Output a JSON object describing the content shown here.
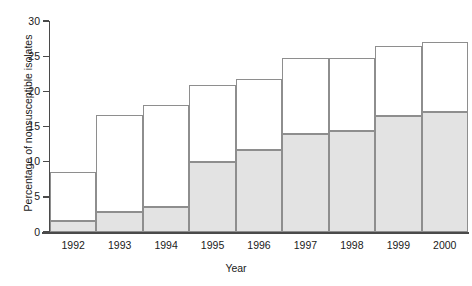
{
  "chart_data": {
    "type": "bar",
    "stacked": true,
    "title": "",
    "xlabel": "Year",
    "ylabel": "Percentage of nonsusceptible isolates",
    "categories": [
      "1992",
      "1993",
      "1994",
      "1995",
      "1996",
      "1997",
      "1998",
      "1999",
      "2000"
    ],
    "ylim": [
      0,
      30
    ],
    "yticks": [
      0,
      5,
      10,
      15,
      20,
      25,
      30
    ],
    "ytick_labels": [
      "0",
      "5",
      "10",
      "15",
      "20",
      "25",
      "30"
    ],
    "grid": false,
    "legend": "none",
    "series": [
      {
        "name": "lower-segment",
        "fill": "#e3e3e3",
        "values": [
          1.6,
          2.9,
          3.5,
          10.0,
          11.6,
          13.9,
          14.3,
          16.5,
          17.1
        ]
      },
      {
        "name": "upper-segment",
        "fill": "#ffffff",
        "values": [
          6.9,
          13.7,
          14.6,
          10.9,
          10.2,
          10.8,
          10.4,
          9.9,
          9.9
        ]
      }
    ],
    "totals": [
      8.5,
      16.6,
      18.1,
      20.9,
      21.8,
      24.7,
      24.7,
      26.4,
      27.0
    ],
    "colors": {
      "lower_fill": "#e3e3e3",
      "upper_fill": "#ffffff",
      "bar_outline": "#8e8e8e",
      "axis": "#4a4a4a",
      "text": "#1a1a1a"
    }
  }
}
